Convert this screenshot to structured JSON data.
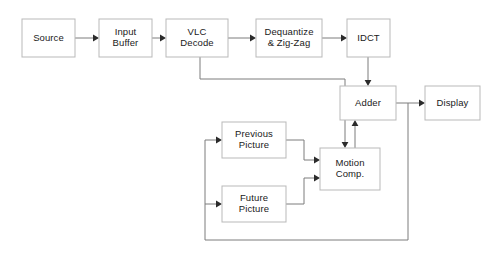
{
  "diagram": {
    "type": "block-diagram",
    "canvas": {
      "width": 490,
      "height": 254
    },
    "colors": {
      "background": "#ffffff",
      "box_border": "#b9b9b9",
      "box_fill": "#ffffff",
      "edge": "#7d7d7d",
      "arrow_head": "#2b2b2b",
      "text": "#1a1a1a"
    },
    "nodes": [
      {
        "id": "source",
        "label": "Source",
        "lines": [
          "Source"
        ],
        "x": 22,
        "y": 19,
        "w": 53,
        "h": 38
      },
      {
        "id": "input_buffer",
        "label": "Input Buffer",
        "lines": [
          "Input",
          "Buffer"
        ],
        "x": 99,
        "y": 19,
        "w": 53,
        "h": 38
      },
      {
        "id": "vlc_decode",
        "label": "VLC Decode",
        "lines": [
          "VLC",
          "Decode"
        ],
        "x": 166,
        "y": 19,
        "w": 62,
        "h": 38
      },
      {
        "id": "dequantize",
        "label": "Dequantize & Zig-Zag",
        "lines": [
          "Dequantize",
          "& Zig-Zag"
        ],
        "x": 256,
        "y": 19,
        "w": 66,
        "h": 38
      },
      {
        "id": "idct",
        "label": "IDCT",
        "lines": [
          "IDCT"
        ],
        "x": 347,
        "y": 19,
        "w": 43,
        "h": 38
      },
      {
        "id": "adder",
        "label": "Adder",
        "lines": [
          "Adder"
        ],
        "x": 340,
        "y": 86,
        "w": 56,
        "h": 34
      },
      {
        "id": "display",
        "label": "Display",
        "lines": [
          "Display"
        ],
        "x": 425,
        "y": 86,
        "w": 55,
        "h": 34
      },
      {
        "id": "previous_picture",
        "label": "Previous Picture",
        "lines": [
          "Previous",
          "Picture"
        ],
        "x": 222,
        "y": 122,
        "w": 64,
        "h": 36
      },
      {
        "id": "future_picture",
        "label": "Future Picture",
        "lines": [
          "Future",
          "Picture"
        ],
        "x": 222,
        "y": 186,
        "w": 64,
        "h": 36
      },
      {
        "id": "motion_comp",
        "label": "Motion Comp.",
        "lines": [
          "Motion",
          "Comp."
        ],
        "x": 320,
        "y": 148,
        "w": 60,
        "h": 42
      }
    ],
    "edges": [
      {
        "id": "source-to-input-buffer",
        "from": "source",
        "to": "input_buffer",
        "path": "M 75 38 L 93 38",
        "arrow": {
          "x": 99,
          "y": 38,
          "dir": "right"
        }
      },
      {
        "id": "input-buffer-to-vlc-decode",
        "from": "input_buffer",
        "to": "vlc_decode",
        "path": "M 152 38 L 160 38",
        "arrow": {
          "x": 166,
          "y": 38,
          "dir": "right"
        }
      },
      {
        "id": "vlc-decode-to-dequantize",
        "from": "vlc_decode",
        "to": "dequantize",
        "path": "M 228 38 L 250 38",
        "arrow": {
          "x": 256,
          "y": 38,
          "dir": "right"
        }
      },
      {
        "id": "dequantize-to-idct",
        "from": "dequantize",
        "to": "idct",
        "path": "M 322 38 L 341 38",
        "arrow": {
          "x": 347,
          "y": 38,
          "dir": "right"
        }
      },
      {
        "id": "idct-to-adder",
        "from": "idct",
        "to": "adder",
        "path": "M 368 57 L 368 80",
        "arrow": {
          "x": 368,
          "y": 86,
          "dir": "down"
        }
      },
      {
        "id": "adder-to-display",
        "from": "adder",
        "to": "display",
        "path": "M 396 103 L 419 103",
        "arrow": {
          "x": 425,
          "y": 103,
          "dir": "right"
        }
      },
      {
        "id": "vlc-decode-to-motion-comp",
        "from": "vlc_decode",
        "to": "motion_comp",
        "path": "M 200 57 L 200 79 L 345 79 L 345 142",
        "arrow": {
          "x": 345,
          "y": 148,
          "dir": "down"
        }
      },
      {
        "id": "motion-comp-to-adder",
        "from": "motion_comp",
        "to": "adder",
        "path": "M 355 148 L 355 126",
        "arrow": {
          "x": 355,
          "y": 120,
          "dir": "up"
        }
      },
      {
        "id": "previous-picture-to-motion-comp",
        "from": "previous_picture",
        "to": "motion_comp",
        "path": "M 286 140 L 304 140 L 304 160 L 314 160",
        "arrow": {
          "x": 320,
          "y": 160,
          "dir": "right"
        }
      },
      {
        "id": "future-picture-to-motion-comp",
        "from": "future_picture",
        "to": "motion_comp",
        "path": "M 286 204 L 304 204 L 304 178 L 314 178",
        "arrow": {
          "x": 320,
          "y": 178,
          "dir": "right"
        }
      },
      {
        "id": "adder-feedback-to-previous-picture",
        "from": "adder",
        "to": "previous_picture",
        "path": "M 408 103 L 408 240 L 205 240 L 205 140 L 216 140",
        "arrow": {
          "x": 222,
          "y": 140,
          "dir": "right"
        }
      },
      {
        "id": "adder-feedback-to-future-picture",
        "from": "adder",
        "to": "future_picture",
        "path": "M 205 204 L 216 204",
        "arrow": {
          "x": 222,
          "y": 204,
          "dir": "right"
        }
      }
    ]
  }
}
